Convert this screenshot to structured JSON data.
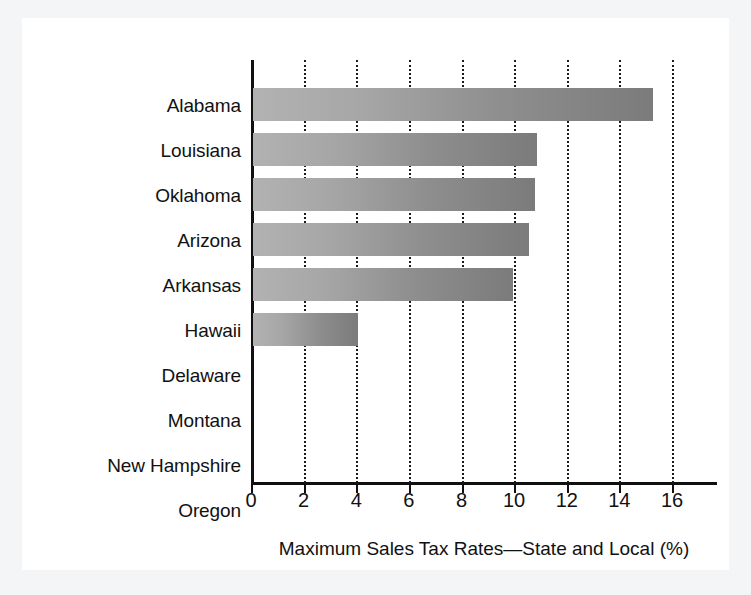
{
  "chart_data": {
    "type": "bar",
    "orientation": "horizontal",
    "title": "",
    "xlabel": "Maximum Sales Tax Rates—State and Local (%)",
    "ylabel": "",
    "categories": [
      "Alabama",
      "Louisiana",
      "Oklahoma",
      "Arizona",
      "Arkansas",
      "Hawaii",
      "Delaware",
      "Montana",
      "New Hampshire",
      "Oregon"
    ],
    "values": [
      15.2,
      10.8,
      10.7,
      10.5,
      9.9,
      4.0,
      0,
      0,
      0,
      0
    ],
    "xlim": [
      0,
      16
    ],
    "xticks": [
      0,
      2,
      4,
      6,
      8,
      10,
      12,
      14,
      16
    ],
    "xtick_labels": [
      "0",
      "2",
      "4",
      "6",
      "8",
      "10",
      "12",
      "14",
      "16"
    ],
    "grid": "vertical-dotted",
    "legend": "none",
    "bar_color_left": "#b2b2b2",
    "bar_color_right": "#7b7b7b",
    "axis_color": "#101010",
    "background": "#ffffff",
    "page_background": "#f4f5f6"
  }
}
